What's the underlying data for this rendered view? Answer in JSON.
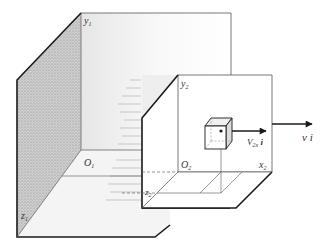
{
  "figure": {
    "type": "diagram",
    "labels": {
      "y1": "y",
      "y1_sub": "1",
      "O1": "O",
      "O1_sub": "1",
      "z1": "z",
      "z1_sub": "1",
      "y2": "y",
      "y2_sub": "2",
      "O2": "O",
      "O2_sub": "2",
      "x2": "x",
      "x2_sub": "2",
      "z2": "z",
      "z2_sub": "2",
      "V2x": "V",
      "V2x_sub": "2x",
      "V2x_suffix": " i",
      "vi": "v i"
    },
    "colors": {
      "line": "#1a1a1a",
      "thin_line": "#555555",
      "shade_left_wall": "#b8b8b8",
      "shade_floor": "#eeeeee"
    }
  }
}
